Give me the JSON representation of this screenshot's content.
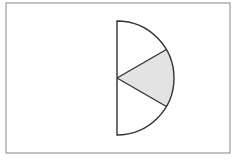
{
  "diagram": {
    "type": "semicircle-sectors",
    "frame": {
      "x": 6,
      "y": 3,
      "width": 224,
      "height": 150,
      "stroke": "#9a9a9a",
      "fill": "#ffffff"
    },
    "semicircle": {
      "center": {
        "x": 117,
        "y": 78
      },
      "radius": 57,
      "orientation": "right",
      "stroke": "#333333",
      "stroke_width": 1.4
    },
    "sectors": [
      {
        "name": "upper",
        "start_deg": -90,
        "end_deg": -30,
        "shaded": false,
        "fill": "#ffffff"
      },
      {
        "name": "middle",
        "start_deg": -30,
        "end_deg": 30,
        "shaded": true,
        "fill": "#e3e3e3"
      },
      {
        "name": "lower",
        "start_deg": 30,
        "end_deg": 90,
        "shaded": false,
        "fill": "#ffffff"
      }
    ],
    "sector_angle_deg": 60,
    "shaded_fraction_of_semicircle": "1/3",
    "shaded_fraction_of_circle": "1/6"
  }
}
